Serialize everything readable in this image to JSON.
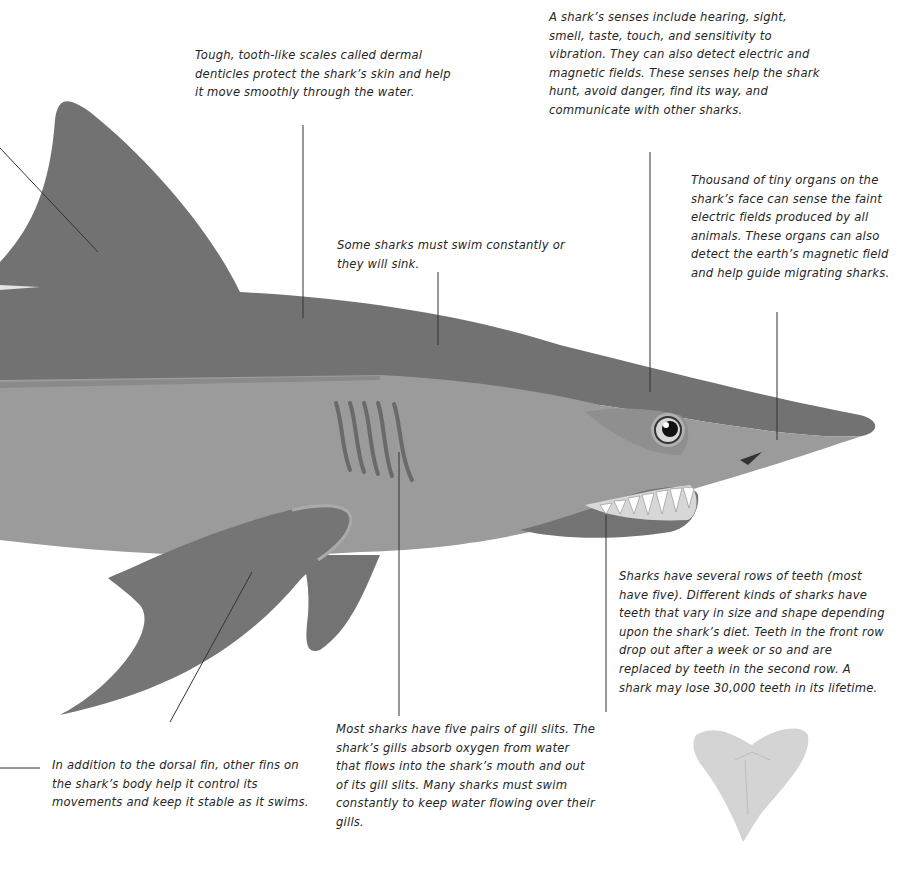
{
  "diagram": {
    "colors": {
      "background": "#ffffff",
      "dorsal_dark": "#6f6f6f",
      "body_light": "#9a9a9a",
      "fin": "#777777",
      "text": "#262626",
      "leader_line": "#333333"
    },
    "labels": {
      "denticles": "Tough, tooth-like scales called dermal denticles protect the shark’s skin and help it move smoothly through the water.",
      "senses": "A shark’s senses include hearing, sight, smell, taste, touch, and sensitivity to vibration. They can also detect electric and magnetic fields. These senses help the shark hunt, avoid danger, find its way, and communicate with other sharks.",
      "electro_organs": "Thousand of tiny organs on the shark’s face can sense the faint electric fields produced by all animals. These organs can also detect the earth’s magnetic field and help guide migrating sharks.",
      "swim": "Some sharks must swim constantly or they will sink.",
      "teeth": "Sharks have several rows of teeth (most have five). Different kinds of sharks have teeth that vary in size and shape depending upon the shark’s diet. Teeth in the front row drop out after a week or so and are replaced by teeth in the second row. A shark may lose 30,000 teeth in its lifetime.",
      "gills": "Most sharks have five pairs of gill slits. The shark’s gills absorb oxygen from water that flows into the shark’s mouth and out of its gill slits. Many sharks must swim constantly to keep water flowing over their gills.",
      "fins": "In addition to the dorsal fin, other fins on the shark’s body help it control its movements and keep it stable as it swims."
    },
    "parts": [
      "dorsal-fin",
      "body",
      "gill-slits",
      "eye",
      "snout",
      "mouth",
      "pectoral-fin",
      "pelvic-fin",
      "tooth"
    ]
  }
}
